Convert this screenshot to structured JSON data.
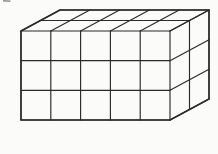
{
  "figure": {
    "type": "cuboid-grid",
    "columns": 5,
    "rows": 3,
    "depth_layers": 2,
    "unit_cubes_total": 30,
    "stroke_color": "#2a2a2a"
  },
  "caption": {
    "text": "式",
    "color": "#3d3d3d"
  },
  "top_edge_fragment": {
    "color": "#8f8f8f"
  }
}
